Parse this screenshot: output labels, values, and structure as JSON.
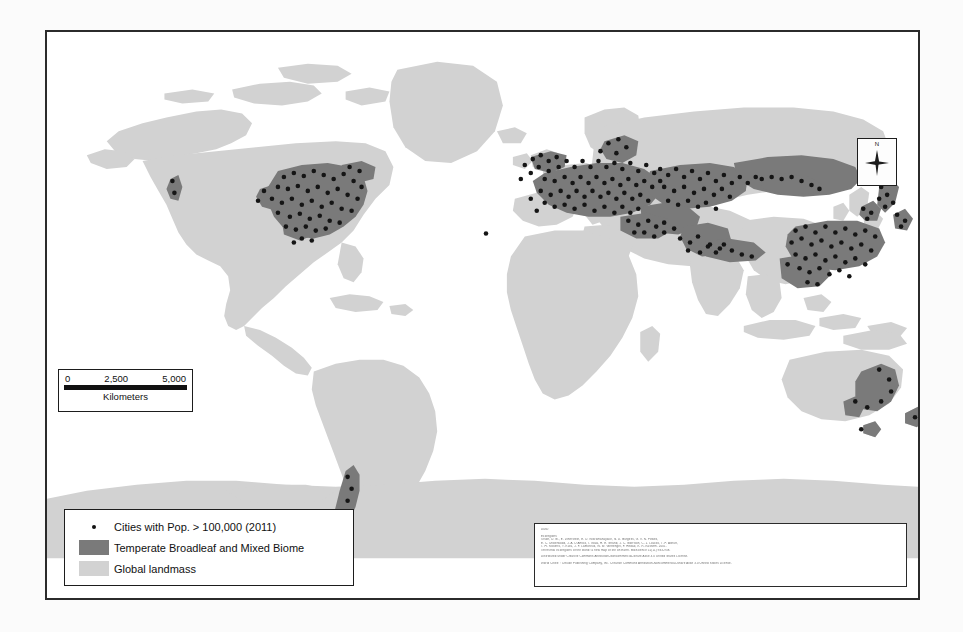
{
  "figure": {
    "kind": "world-map",
    "projection_note": "world map, temperate broadleaf and mixed forest biome with large cities"
  },
  "scale_bar": {
    "ticks": [
      "0",
      "2,500",
      "5,000"
    ],
    "units": "Kilometers"
  },
  "north_arrow": {
    "label": "N"
  },
  "legend": {
    "items": [
      {
        "key": "dot",
        "label": "Cities with Pop. > 100,000 (2011)",
        "color": "#111111"
      },
      {
        "key": "swatch",
        "label": "Temperate Broadleaf and Mixed Biome",
        "color": "#7a7a7a"
      },
      {
        "key": "swatch",
        "label": "Global landmass",
        "color": "#d2d2d2"
      }
    ]
  },
  "citation": {
    "heading": "Data:",
    "lines": [
      "Ecoregions",
      "Olson, D. M., E. Dinerstein, E. D. Wikramanayake, N. D. Burgess, G. V. N. Powell,",
      "E. C. Underwood, J. A. D'Amico, I. Itoua, H. E. Strand, J. C. Morrison, C. J. Loucks, T. F. Allnutt,",
      "T. H. Ricketts, Y. Kura, J. F. Lamoreux, W. W. Wettengel, P. Hedao, K. R. Kassem. 2001.",
      "Terrestrial ecoregions of the world: a new map of life on Earth. BioScience 51(11):933-938.",
      "",
      "Distributed under Creative Commons Attribution-Noncommercial-Share Alike 3.0 United States License.",
      "",
      "World Cities: : Deluxe Publishing Company, Inc. Creative Commons Attribution-Noncommercial-Share Alike 3.0 United States License."
    ]
  },
  "colors": {
    "landmass": "#d2d2d2",
    "biome": "#7a7a7a",
    "city": "#151515",
    "frame": "#2b2b2b",
    "page_background": "#fbfbfb",
    "map_background": "#ffffff"
  }
}
